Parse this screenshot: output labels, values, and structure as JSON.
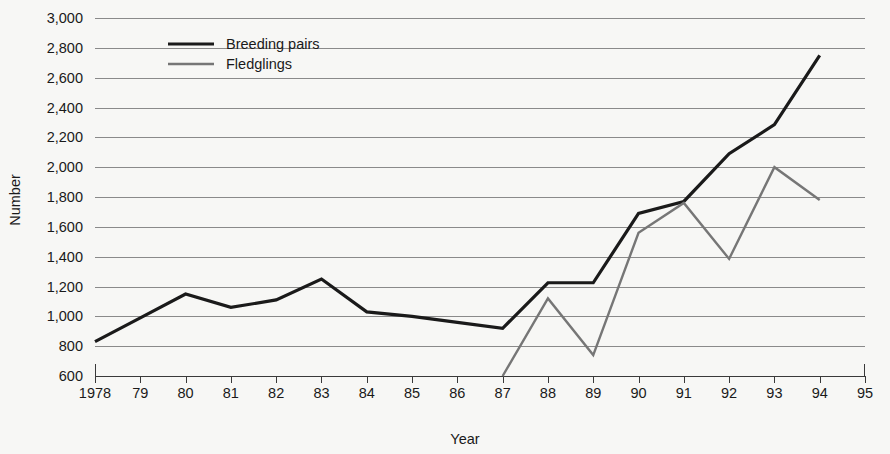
{
  "chart_data": {
    "type": "line",
    "title": "",
    "xlabel": "Year",
    "ylabel": "Number",
    "grid": true,
    "legend_position": "top-left-inside",
    "xlim": [
      1978,
      1995
    ],
    "ylim": [
      600,
      3000
    ],
    "y_tick_step": 200,
    "x": [
      1978,
      1979,
      1980,
      1981,
      1982,
      1983,
      1984,
      1985,
      1986,
      1987,
      1988,
      1989,
      1990,
      1991,
      1992,
      1993,
      1994
    ],
    "x_tick_labels": [
      "1978",
      "79",
      "80",
      "81",
      "82",
      "83",
      "84",
      "85",
      "86",
      "87",
      "88",
      "89",
      "90",
      "91",
      "92",
      "93",
      "94",
      "95"
    ],
    "x_tick_values": [
      1978,
      1979,
      1980,
      1981,
      1982,
      1983,
      1984,
      1985,
      1986,
      1987,
      1988,
      1989,
      1990,
      1991,
      1992,
      1993,
      1994,
      1995
    ],
    "y_tick_labels": [
      "3,000",
      "2,800",
      "2,600",
      "2,400",
      "2,200",
      "2,000",
      "1,800",
      "1,600",
      "1,400",
      "1,200",
      "1,000",
      "800",
      "600"
    ],
    "y_tick_values": [
      3000,
      2800,
      2600,
      2400,
      2200,
      2000,
      1800,
      1600,
      1400,
      1200,
      1000,
      800,
      600
    ],
    "series": [
      {
        "name": "Breeding pairs",
        "color": "#1a1a1a",
        "width": 3.2,
        "x": [
          1978,
          1979,
          1980,
          1981,
          1982,
          1983,
          1984,
          1985,
          1986,
          1987,
          1988,
          1989,
          1990,
          1991,
          1992,
          1993,
          1994
        ],
        "values": [
          830,
          990,
          1150,
          1060,
          1110,
          1250,
          1030,
          1000,
          960,
          920,
          1225,
          1225,
          1690,
          1770,
          2090,
          2285,
          2750
        ]
      },
      {
        "name": "Fledglings",
        "color": "#767676",
        "width": 2.4,
        "x": [
          1987,
          1988,
          1989,
          1990,
          1991,
          1992,
          1993,
          1994
        ],
        "values": [
          600,
          1120,
          740,
          1560,
          1760,
          1385,
          2000,
          1780
        ]
      }
    ]
  },
  "legend": {
    "items": [
      {
        "label": "Breeding pairs",
        "color": "#1a1a1a",
        "width": 3.2
      },
      {
        "label": "Fledglings",
        "color": "#767676",
        "width": 2.4
      }
    ]
  },
  "colors": {
    "background": "#f7f7f5",
    "gridline": "#8a8a8a",
    "axis": "#3a3a3a",
    "text": "#1a1a1a",
    "breeding_pairs": "#1a1a1a",
    "fledglings": "#767676"
  }
}
